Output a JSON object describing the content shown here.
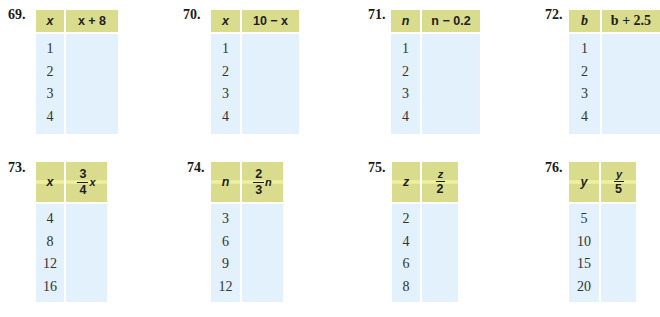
{
  "exercises": [
    {
      "number": "69.",
      "input_header": "x",
      "output_header": "x + 8",
      "values": [
        "1",
        "2",
        "3",
        "4"
      ]
    },
    {
      "number": "70.",
      "input_header": "x",
      "output_header": "10 − x",
      "values": [
        "1",
        "2",
        "3",
        "4"
      ]
    },
    {
      "number": "71.",
      "input_header": "n",
      "output_header": "n − 0.2",
      "values": [
        "1",
        "2",
        "3",
        "4"
      ]
    },
    {
      "number": "72.",
      "input_header": "b",
      "output_header": "b + 2.5",
      "values": [
        "1",
        "2",
        "3",
        "4"
      ]
    },
    {
      "number": "73.",
      "input_header": "x",
      "output_header": {
        "numerator": "3",
        "denominator": "4",
        "suffix": "x"
      },
      "values": [
        "4",
        "8",
        "12",
        "16"
      ]
    },
    {
      "number": "74.",
      "input_header": "n",
      "output_header": {
        "numerator": "2",
        "denominator": "3",
        "suffix": "n"
      },
      "values": [
        "3",
        "6",
        "9",
        "12"
      ]
    },
    {
      "number": "75.",
      "input_header": "z",
      "output_header": {
        "numerator": "z",
        "denominator": "2",
        "suffix": ""
      },
      "values": [
        "2",
        "4",
        "6",
        "8"
      ]
    },
    {
      "number": "76.",
      "input_header": "y",
      "output_header": {
        "numerator": "y",
        "denominator": "5",
        "suffix": ""
      },
      "values": [
        "5",
        "10",
        "15",
        "20"
      ]
    }
  ],
  "colors": {
    "header_bg": "#d8dc8c",
    "header_highlight": "#eef09c",
    "body_bg": "#e2f1fb"
  }
}
